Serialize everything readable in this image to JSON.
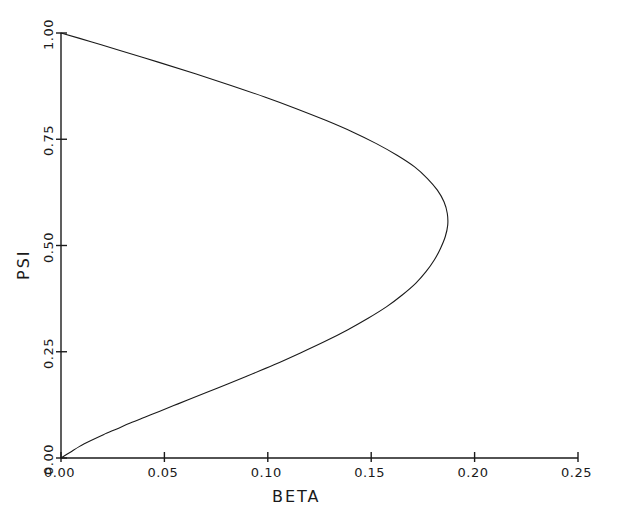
{
  "chart_data": {
    "type": "line",
    "title": "",
    "xlabel": "BETA",
    "ylabel": "PSI",
    "xlim": [
      0.0,
      0.25
    ],
    "ylim": [
      0.0,
      1.0
    ],
    "grid": false,
    "legend": null,
    "xticks": [
      "0.00",
      "0.05",
      "0.10",
      "0.15",
      "0.20",
      "0.25"
    ],
    "xtick_values": [
      0.0,
      0.05,
      0.1,
      0.15,
      0.2,
      0.25
    ],
    "yticks": [
      "0.00",
      "0.25",
      "0.50",
      "0.75",
      "1.00"
    ],
    "ytick_values": [
      0.0,
      0.25,
      0.5,
      0.75,
      1.0
    ],
    "series": [
      {
        "name": "psi-beta-nose-curve",
        "color": "#1a1a1a",
        "linewidth": 1.1,
        "note": "C-shaped nose curve opening left; max BETA 0.187 at PSI 0.59",
        "points": [
          [
            0.0,
            0.0
          ],
          [
            0.0045,
            0.02
          ],
          [
            0.009,
            0.04
          ],
          [
            0.0145,
            0.06
          ],
          [
            0.0205,
            0.08
          ],
          [
            0.027,
            0.1
          ],
          [
            0.0335,
            0.12
          ],
          [
            0.0405,
            0.14
          ],
          [
            0.0475,
            0.16
          ],
          [
            0.0545,
            0.18
          ],
          [
            0.0615,
            0.2
          ],
          [
            0.0755,
            0.24
          ],
          [
            0.0895,
            0.28
          ],
          [
            0.103,
            0.32
          ],
          [
            0.1155,
            0.36
          ],
          [
            0.1275,
            0.4
          ],
          [
            0.1385,
            0.44
          ],
          [
            0.1485,
            0.48
          ],
          [
            0.1575,
            0.52
          ],
          [
            0.165,
            0.56
          ],
          [
            0.1715,
            0.6
          ],
          [
            0.1765,
            0.64
          ],
          [
            0.1805,
            0.68
          ],
          [
            0.1835,
            0.72
          ],
          [
            0.1858,
            0.76
          ],
          [
            0.187,
            0.8
          ],
          [
            0.1868,
            0.84
          ],
          [
            0.1852,
            0.88
          ],
          [
            0.182,
            0.92
          ],
          [
            0.1772,
            0.96
          ],
          [
            0.171,
            1.0
          ],
          [
            0.1625,
            1.04
          ],
          [
            0.1525,
            1.08
          ],
          [
            0.141,
            1.12
          ],
          [
            0.128,
            1.16
          ],
          [
            0.1138,
            1.2
          ],
          [
            0.0985,
            1.24
          ],
          [
            0.0822,
            1.28
          ],
          [
            0.065,
            1.32
          ],
          [
            0.047,
            1.36
          ],
          [
            0.0285,
            1.4
          ],
          [
            0.0145,
            1.43
          ],
          [
            0.0,
            1.46
          ]
        ]
      }
    ]
  },
  "axes": {
    "x_axis_name": "beta-axis",
    "y_axis_name": "psi-axis"
  }
}
